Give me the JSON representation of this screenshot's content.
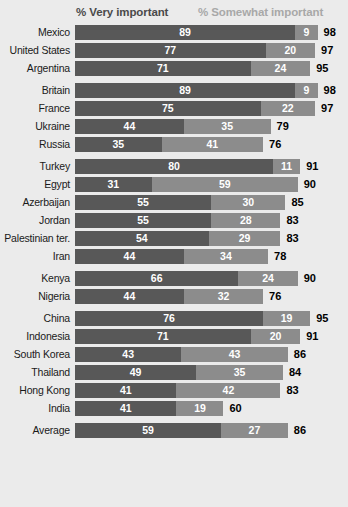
{
  "legend": {
    "very_important": "% Very important",
    "somewhat_important": "% Somewhat important"
  },
  "colors": {
    "background": "#ebebeb",
    "very_important_bar": "#585858",
    "somewhat_important_bar": "#8c8c8c",
    "legend_very_text": "#4a4a4a",
    "legend_somewhat_text": "#a8a8a8",
    "segment_value_text": "#ffffff",
    "total_text": "#000000",
    "label_text": "#1a1a1a"
  },
  "chart_data": {
    "type": "bar",
    "title": "",
    "subtitle": "",
    "xlabel": "",
    "ylabel": "",
    "orientation": "horizontal",
    "stacked": true,
    "grid": false,
    "legend_position": "top",
    "xlim": [
      0,
      100
    ],
    "categories": [
      "Mexico",
      "United States",
      "Argentina",
      "Britain",
      "France",
      "Ukraine",
      "Russia",
      "Turkey",
      "Egypt",
      "Azerbaijan",
      "Jordan",
      "Palestinian ter.",
      "Iran",
      "Kenya",
      "Nigeria",
      "China",
      "Indonesia",
      "South Korea",
      "Thailand",
      "Hong Kong",
      "India",
      "Average"
    ],
    "series": [
      {
        "name": "% Very important",
        "values": [
          89,
          77,
          71,
          89,
          75,
          44,
          35,
          80,
          31,
          55,
          55,
          54,
          44,
          66,
          44,
          76,
          71,
          43,
          49,
          41,
          41,
          59
        ]
      },
      {
        "name": "% Somewhat important",
        "values": [
          9,
          20,
          24,
          9,
          22,
          35,
          41,
          11,
          59,
          30,
          28,
          29,
          34,
          24,
          32,
          19,
          20,
          43,
          35,
          42,
          19,
          27
        ]
      }
    ],
    "totals": [
      98,
      97,
      95,
      98,
      97,
      79,
      76,
      91,
      90,
      85,
      83,
      83,
      78,
      90,
      76,
      95,
      91,
      86,
      84,
      83,
      60,
      86
    ]
  },
  "groups": [
    {
      "name": "americas",
      "rows": [
        {
          "label": "Mexico",
          "very": 89,
          "somewhat": 9,
          "total": 98
        },
        {
          "label": "United States",
          "very": 77,
          "somewhat": 20,
          "total": 97
        },
        {
          "label": "Argentina",
          "very": 71,
          "somewhat": 24,
          "total": 95
        }
      ]
    },
    {
      "name": "europe",
      "rows": [
        {
          "label": "Britain",
          "very": 89,
          "somewhat": 9,
          "total": 98
        },
        {
          "label": "France",
          "very": 75,
          "somewhat": 22,
          "total": 97
        },
        {
          "label": "Ukraine",
          "very": 44,
          "somewhat": 35,
          "total": 79
        },
        {
          "label": "Russia",
          "very": 35,
          "somewhat": 41,
          "total": 76
        }
      ]
    },
    {
      "name": "middle-east",
      "rows": [
        {
          "label": "Turkey",
          "very": 80,
          "somewhat": 11,
          "total": 91
        },
        {
          "label": "Egypt",
          "very": 31,
          "somewhat": 59,
          "total": 90
        },
        {
          "label": "Azerbaijan",
          "very": 55,
          "somewhat": 30,
          "total": 85
        },
        {
          "label": "Jordan",
          "very": 55,
          "somewhat": 28,
          "total": 83
        },
        {
          "label": "Palestinian ter.",
          "very": 54,
          "somewhat": 29,
          "total": 83
        },
        {
          "label": "Iran",
          "very": 44,
          "somewhat": 34,
          "total": 78
        }
      ]
    },
    {
      "name": "africa",
      "rows": [
        {
          "label": "Kenya",
          "very": 66,
          "somewhat": 24,
          "total": 90
        },
        {
          "label": "Nigeria",
          "very": 44,
          "somewhat": 32,
          "total": 76
        }
      ]
    },
    {
      "name": "asia",
      "rows": [
        {
          "label": "China",
          "very": 76,
          "somewhat": 19,
          "total": 95
        },
        {
          "label": "Indonesia",
          "very": 71,
          "somewhat": 20,
          "total": 91
        },
        {
          "label": "South Korea",
          "very": 43,
          "somewhat": 43,
          "total": 86
        },
        {
          "label": "Thailand",
          "very": 49,
          "somewhat": 35,
          "total": 84
        },
        {
          "label": "Hong Kong",
          "very": 41,
          "somewhat": 42,
          "total": 83
        },
        {
          "label": "India",
          "very": 41,
          "somewhat": 19,
          "total": 60
        }
      ]
    },
    {
      "name": "average",
      "rows": [
        {
          "label": "Average",
          "very": 59,
          "somewhat": 27,
          "total": 86
        }
      ]
    }
  ]
}
